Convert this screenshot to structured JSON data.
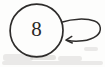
{
  "diagram": {
    "type": "state-transition",
    "background_color": "#fdfdfc",
    "ink_color": "#2e2c2b",
    "nodes": [
      {
        "id": "state-8",
        "label": "8",
        "shape": "circle",
        "center_x": 36.5,
        "center_y": 30.5,
        "radius": 26.5
      }
    ],
    "edges": [
      {
        "id": "self-loop-8",
        "from": "state-8",
        "to": "state-8",
        "kind": "self-loop",
        "label": "",
        "arrowhead": "open",
        "direction": "left",
        "side": "right"
      }
    ],
    "artifacts": {
      "scan_smudge_label": "scan smudge"
    }
  }
}
